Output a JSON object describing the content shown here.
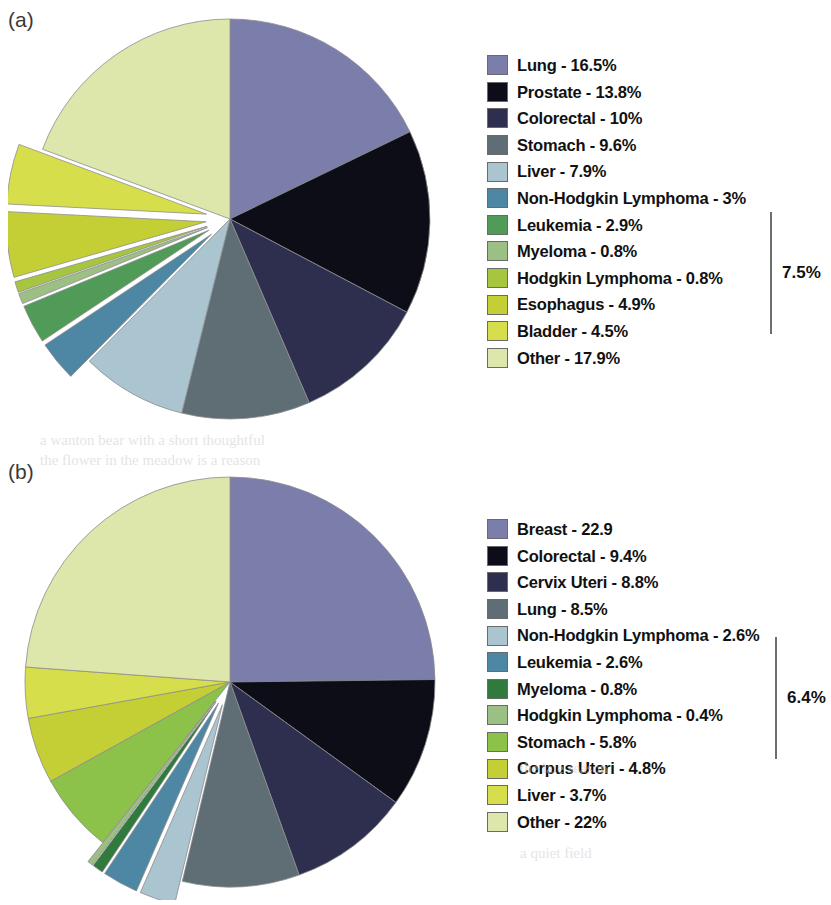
{
  "figure": {
    "panels": [
      {
        "label": "(a)",
        "bracket_label": "7.5%",
        "bracket_from": 5,
        "bracket_to": 8
      },
      {
        "label": "(b)",
        "bracket_label": "6.4%",
        "bracket_from": 4,
        "bracket_to": 7
      }
    ]
  },
  "chart_data": [
    {
      "type": "pie",
      "title": "(a)",
      "panel": "a",
      "unit": "%",
      "start_angle": -90,
      "direction": "clockwise",
      "annotations": [
        "7.5%"
      ],
      "legend_position": "right",
      "categories": [
        "Lung",
        "Prostate",
        "Colorectal",
        "Stomach",
        "Liver",
        "Non-Hodgkin Lymphoma",
        "Leukemia",
        "Myeloma",
        "Hodgkin Lymphoma",
        "Esophagus",
        "Bladder",
        "Other"
      ],
      "values": [
        16.5,
        13.8,
        10,
        9.6,
        7.9,
        3,
        2.9,
        0.8,
        0.8,
        4.9,
        4.5,
        17.9
      ],
      "labels": [
        "Lung - 16.5%",
        "Prostate - 13.8%",
        "Colorectal - 10%",
        "Stomach - 9.6%",
        "Liver - 7.9%",
        "Non-Hodgkin Lymphoma - 3%",
        "Leukemia - 2.9%",
        "Myeloma - 0.8%",
        "Hodgkin Lymphoma - 0.8%",
        "Esophagus - 4.9%",
        "Bladder - 4.5%",
        "Other - 17.9%"
      ],
      "colors": [
        "#7b7dab",
        "#0d0d18",
        "#2e2f4f",
        "#5f6d75",
        "#aac4d0",
        "#4d87a3",
        "#4f9b57",
        "#9cc083",
        "#a7c63f",
        "#c4cf36",
        "#d7de4c",
        "#dde7ab"
      ],
      "exploded": [
        false,
        false,
        false,
        false,
        false,
        true,
        true,
        true,
        true,
        true,
        true,
        false
      ]
    },
    {
      "type": "pie",
      "title": "(b)",
      "panel": "b",
      "unit": "%",
      "start_angle": -90,
      "direction": "clockwise",
      "annotations": [
        "6.4%"
      ],
      "legend_position": "right",
      "categories": [
        "Breast",
        "Colorectal",
        "Cervix Uteri",
        "Lung",
        "Non-Hodgkin Lymphoma",
        "Leukemia",
        "Myeloma",
        "Hodgkin Lymphoma",
        "Stomach",
        "Corpus Uteri",
        "Liver",
        "Other"
      ],
      "values": [
        22.9,
        9.4,
        8.8,
        8.5,
        2.6,
        2.6,
        0.8,
        0.4,
        5.8,
        4.8,
        3.7,
        22
      ],
      "labels": [
        "Breast - 22.9",
        "Colorectal - 9.4%",
        "Cervix Uteri - 8.8%",
        "Lung - 8.5%",
        "Non-Hodgkin Lymphoma - 2.6%",
        "Leukemia - 2.6%",
        "Myeloma - 0.8%",
        "Hodgkin Lymphoma - 0.4%",
        "Stomach - 5.8%",
        "Corpus Uteri - 4.8%",
        "Liver - 3.7%",
        "Other - 22%"
      ],
      "colors": [
        "#7b7dab",
        "#0d0d18",
        "#2e2f4f",
        "#5f6d75",
        "#aac4d0",
        "#4d87a3",
        "#2f7a3c",
        "#9cc083",
        "#8cc249",
        "#c4cf36",
        "#d7de4c",
        "#dde7ab"
      ],
      "exploded": [
        false,
        false,
        false,
        false,
        true,
        true,
        true,
        true,
        false,
        false,
        false,
        false
      ]
    }
  ]
}
